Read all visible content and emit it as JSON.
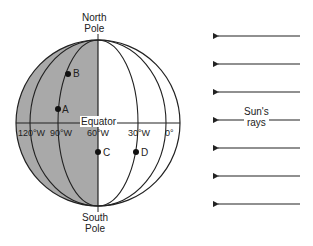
{
  "diagram": {
    "north_pole": [
      "North",
      "Pole"
    ],
    "south_pole": [
      "South",
      "Pole"
    ],
    "equator_label": "Equator",
    "longitudes": [
      "120°W",
      "90°W",
      "60°W",
      "30°W",
      "0°"
    ],
    "points": [
      {
        "label": "B",
        "longitude": "90°W",
        "hemisphere": "north"
      },
      {
        "label": "A",
        "longitude": "90°W",
        "hemisphere": "north"
      },
      {
        "label": "C",
        "longitude": "60°W",
        "hemisphere": "south"
      },
      {
        "label": "D",
        "longitude": "30°W",
        "hemisphere": "south"
      }
    ],
    "sun_rays_label": [
      "Sun's",
      "rays"
    ],
    "colors": {
      "night_side": "#a9a9a9",
      "day_side": "#ffffff",
      "lines": "#222222"
    }
  }
}
